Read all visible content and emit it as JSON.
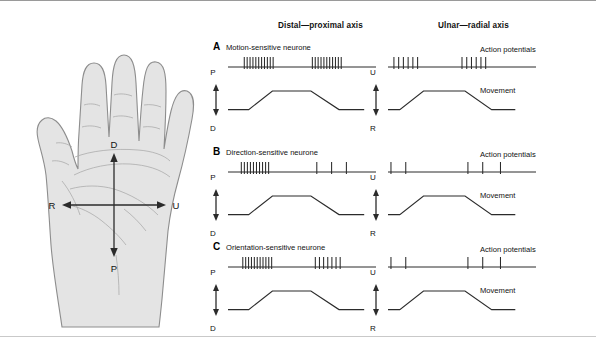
{
  "figure": {
    "columns": [
      {
        "id": "distal-proximal",
        "header": "Distal—proximal axis"
      },
      {
        "id": "ulnar-radial",
        "header": "Ulnar—radial axis"
      }
    ],
    "trace_labels": {
      "action_potentials": "Action potentials",
      "movement": "Movement"
    },
    "hand": {
      "axis_labels": {
        "top": "D",
        "bottom": "P",
        "left": "R",
        "right": "U"
      },
      "fill_color": "#e4e4e4",
      "stroke_color": "#8d8d8d"
    },
    "panels": [
      {
        "letter": "A",
        "title": "Motion-sensitive neurone",
        "columns": [
          {
            "axis_id": "distal-proximal",
            "axis_arrow": {
              "top": "P",
              "bottom": "D"
            },
            "show_labels": false,
            "spike_bursts": [
              {
                "start": 0.11,
                "count": 11,
                "spacing": 0.0195
              },
              {
                "start": 0.57,
                "count": 11,
                "spacing": 0.0195
              }
            ],
            "movement_profile": [
              [
                0.0,
                0.82
              ],
              [
                0.14,
                0.82
              ],
              [
                0.3,
                0.2
              ],
              [
                0.56,
                0.2
              ],
              [
                0.75,
                0.82
              ],
              [
                0.92,
                0.82
              ]
            ]
          },
          {
            "axis_id": "ulnar-radial",
            "axis_arrow": {
              "top": "U",
              "bottom": "R"
            },
            "show_labels": true,
            "spike_bursts": [
              {
                "start": 0.04,
                "count": 6,
                "spacing": 0.032
              },
              {
                "start": 0.5,
                "count": 6,
                "spacing": 0.032
              }
            ],
            "movement_profile": [
              [
                0.0,
                0.82
              ],
              [
                0.08,
                0.82
              ],
              [
                0.24,
                0.2
              ],
              [
                0.52,
                0.2
              ],
              [
                0.7,
                0.82
              ],
              [
                0.86,
                0.82
              ]
            ]
          }
        ]
      },
      {
        "letter": "B",
        "title": "Direction-sensitive neurone",
        "columns": [
          {
            "axis_id": "distal-proximal",
            "axis_arrow": {
              "top": "P",
              "bottom": "D"
            },
            "show_labels": false,
            "spike_bursts": [
              {
                "start": 0.09,
                "count": 10,
                "spacing": 0.0205
              },
              {
                "start": 0.6,
                "count": 1,
                "spacing": 0.0
              },
              {
                "start": 0.7,
                "count": 1,
                "spacing": 0.0
              },
              {
                "start": 0.8,
                "count": 1,
                "spacing": 0.0
              }
            ],
            "movement_profile": [
              [
                0.0,
                0.82
              ],
              [
                0.14,
                0.82
              ],
              [
                0.3,
                0.2
              ],
              [
                0.56,
                0.2
              ],
              [
                0.75,
                0.82
              ],
              [
                0.92,
                0.82
              ]
            ]
          },
          {
            "axis_id": "ulnar-radial",
            "axis_arrow": {
              "top": "U",
              "bottom": "R"
            },
            "show_labels": true,
            "spike_bursts": [
              {
                "start": 0.02,
                "count": 1,
                "spacing": 0.0
              },
              {
                "start": 0.12,
                "count": 1,
                "spacing": 0.0
              },
              {
                "start": 0.54,
                "count": 1,
                "spacing": 0.0
              },
              {
                "start": 0.64,
                "count": 1,
                "spacing": 0.0
              },
              {
                "start": 0.76,
                "count": 1,
                "spacing": 0.0
              }
            ],
            "movement_profile": [
              [
                0.0,
                0.82
              ],
              [
                0.08,
                0.82
              ],
              [
                0.24,
                0.2
              ],
              [
                0.52,
                0.2
              ],
              [
                0.7,
                0.82
              ],
              [
                0.86,
                0.82
              ]
            ]
          }
        ]
      },
      {
        "letter": "C",
        "title": "Orientation-sensitive neurone",
        "columns": [
          {
            "axis_id": "distal-proximal",
            "axis_arrow": {
              "top": "P",
              "bottom": "D"
            },
            "show_labels": false,
            "spike_bursts": [
              {
                "start": 0.1,
                "count": 11,
                "spacing": 0.0195
              },
              {
                "start": 0.59,
                "count": 7,
                "spacing": 0.028
              }
            ],
            "movement_profile": [
              [
                0.0,
                0.82
              ],
              [
                0.14,
                0.82
              ],
              [
                0.3,
                0.2
              ],
              [
                0.56,
                0.2
              ],
              [
                0.75,
                0.82
              ],
              [
                0.92,
                0.82
              ]
            ]
          },
          {
            "axis_id": "ulnar-radial",
            "axis_arrow": {
              "top": "U",
              "bottom": "R"
            },
            "show_labels": true,
            "spike_bursts": [
              {
                "start": 0.02,
                "count": 1,
                "spacing": 0.0
              },
              {
                "start": 0.12,
                "count": 1,
                "spacing": 0.0
              },
              {
                "start": 0.54,
                "count": 1,
                "spacing": 0.0
              },
              {
                "start": 0.64,
                "count": 1,
                "spacing": 0.0
              },
              {
                "start": 0.76,
                "count": 1,
                "spacing": 0.0
              }
            ],
            "movement_profile": [
              [
                0.0,
                0.82
              ],
              [
                0.08,
                0.82
              ],
              [
                0.24,
                0.2
              ],
              [
                0.52,
                0.2
              ],
              [
                0.7,
                0.82
              ],
              [
                0.86,
                0.82
              ]
            ]
          }
        ]
      }
    ]
  }
}
